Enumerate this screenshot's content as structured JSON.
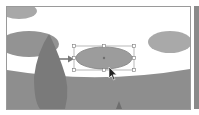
{
  "canvas": {
    "background": "#ffffff",
    "ground_color": "#8e8e8e",
    "shape_color": "#9c9c9c",
    "tree_color": "#7c7c7c"
  },
  "selection": {
    "shape": "ellipse",
    "handles": 8,
    "center_point": true,
    "stroke_color": "#8a8a8a"
  },
  "annotation": {
    "arrow_direction": "right",
    "cursor": "selection-arrow"
  }
}
